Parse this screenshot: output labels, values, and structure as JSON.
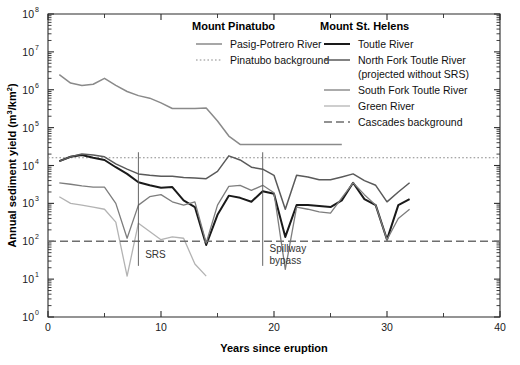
{
  "figure": {
    "background_color": "#ffffff",
    "width": 520,
    "height": 365
  },
  "axes": {
    "xlabel": "Years since eruption",
    "ylabel_main": "Annual sediment yield (m",
    "ylabel_sup1": "3",
    "ylabel_mid": "/km",
    "ylabel_sup2": "2",
    "ylabel_end": ")",
    "x_ticklabels": [
      "0",
      "10",
      "20",
      "30",
      "40"
    ],
    "x_tickvalues": [
      0,
      10,
      20,
      30,
      40
    ],
    "x_minor_step": 5,
    "y_ticklabels": [
      "10",
      "10",
      "10",
      "10",
      "10",
      "10",
      "10",
      "10",
      "10"
    ],
    "y_tick_exponents": [
      "0",
      "1",
      "2",
      "3",
      "4",
      "5",
      "6",
      "7",
      "8"
    ]
  },
  "legend": {
    "group_pinatubo": {
      "title": "Mount Pinatubo",
      "items": [
        {
          "label": "Pasig-Potrero River",
          "color": "#8a8a8a",
          "style": "solid",
          "width": 1.5
        },
        {
          "label": "Pinatubo background",
          "color": "#8a8a8a",
          "style": "dotted",
          "width": 1.2
        }
      ]
    },
    "group_sthelens": {
      "title": "Mount St. Helens",
      "items": [
        {
          "label": "Toutle River",
          "color": "#1a1a1a",
          "style": "solid",
          "width": 2.0
        },
        {
          "label": "North Fork Toutle River",
          "label2": "(projected without SRS)",
          "color": "#5a5a5a",
          "style": "solid",
          "width": 1.5
        },
        {
          "label": "South Fork Toutle River",
          "color": "#7d7d7d",
          "style": "solid",
          "width": 1.3
        },
        {
          "label": "Green River",
          "color": "#b3b3b3",
          "style": "solid",
          "width": 1.3
        },
        {
          "label": "Cascades background",
          "color": "#6e6e6e",
          "style": "dashdot",
          "width": 1.4
        }
      ]
    }
  },
  "annotations": [
    {
      "name": "srs-marker",
      "label": "SRS",
      "x": 8,
      "label_x": 8.6,
      "label_y_log": 1.55
    },
    {
      "name": "spillway-bypass-marker",
      "label": "Spillway",
      "label2": "bypass",
      "x": 19,
      "label_x": 19.6,
      "label_y_log": 1.72
    }
  ],
  "chart_data": {
    "type": "line",
    "title": "",
    "xlabel": "Years since eruption",
    "ylabel": "Annual sediment yield (m3/km2)",
    "yscale": "log",
    "xlim": [
      0,
      40
    ],
    "ylim": [
      1,
      100000000
    ],
    "grid": false,
    "legend_position": "top-center",
    "series": [
      {
        "name": "Pasig-Potrero River",
        "group": "Mount Pinatubo",
        "color": "#8a8a8a",
        "style": "solid",
        "x": [
          1,
          2,
          3,
          4,
          5,
          6,
          7,
          8,
          9,
          10,
          11,
          12,
          13,
          14,
          15,
          16,
          17,
          18,
          19,
          20,
          21,
          22,
          23,
          24,
          25,
          26
        ],
        "y": [
          2500000,
          1500000,
          1300000,
          1400000,
          2000000,
          1300000,
          900000,
          700000,
          600000,
          450000,
          320000,
          320000,
          320000,
          330000,
          150000,
          60000,
          36000,
          36000,
          36000,
          36000,
          36000,
          36000,
          36000,
          36000,
          36000,
          36000
        ]
      },
      {
        "name": "Pinatubo background",
        "group": "Mount Pinatubo",
        "color": "#8a8a8a",
        "style": "dotted",
        "constant": 16000,
        "x": [
          0,
          40
        ]
      },
      {
        "name": "Toutle River",
        "group": "Mount St. Helens",
        "color": "#1a1a1a",
        "style": "solid",
        "x": [
          1,
          2,
          3,
          4,
          5,
          6,
          7,
          8,
          9,
          10,
          11,
          12,
          13,
          14,
          15,
          16,
          17,
          18,
          19,
          20,
          21,
          22,
          23,
          24,
          25,
          26,
          27,
          28,
          29,
          30,
          31,
          32
        ],
        "y": [
          13000,
          17000,
          19000,
          16000,
          14000,
          9000,
          6000,
          3600,
          3000,
          2600,
          2700,
          1200,
          800,
          80,
          500,
          1600,
          1400,
          1100,
          2100,
          1800,
          130,
          900,
          900,
          850,
          800,
          1200,
          3500,
          1300,
          900,
          110,
          900,
          1300
        ]
      },
      {
        "name": "North Fork Toutle River (projected without SRS)",
        "group": "Mount St. Helens",
        "color": "#5a5a5a",
        "style": "solid",
        "x": [
          1,
          2,
          3,
          4,
          5,
          6,
          7,
          8,
          9,
          10,
          11,
          12,
          13,
          14,
          15,
          16,
          17,
          18,
          19,
          20,
          21,
          22,
          23,
          24,
          25,
          26,
          27,
          28,
          29,
          30,
          31,
          32
        ],
        "y": [
          13000,
          17000,
          20000,
          19000,
          17000,
          11000,
          8000,
          6000,
          5500,
          5200,
          5200,
          4800,
          4700,
          4500,
          7000,
          18000,
          14000,
          9000,
          8000,
          5500,
          700,
          5500,
          5000,
          4200,
          4200,
          5000,
          6000,
          4000,
          3000,
          1100,
          2000,
          3500
        ]
      },
      {
        "name": "South Fork Toutle River",
        "group": "Mount St. Helens",
        "color": "#7d7d7d",
        "style": "solid",
        "x": [
          1,
          2,
          3,
          4,
          5,
          6,
          7,
          8,
          9,
          10,
          11,
          12,
          13,
          14,
          15,
          16,
          17,
          18,
          19,
          20,
          21,
          22,
          23,
          24,
          25,
          26,
          27,
          28,
          29,
          30,
          31,
          32
        ],
        "y": [
          3500,
          3200,
          2900,
          2700,
          2700,
          1000,
          120,
          900,
          1500,
          1700,
          1100,
          900,
          1100,
          90,
          900,
          2800,
          3000,
          2200,
          3000,
          1900,
          18,
          800,
          700,
          600,
          550,
          1400,
          3500,
          1700,
          900,
          110,
          400,
          700
        ]
      },
      {
        "name": "Green River",
        "group": "Mount St. Helens",
        "color": "#b3b3b3",
        "style": "solid",
        "x": [
          1,
          2,
          3,
          4,
          5,
          6,
          7,
          8,
          9,
          10,
          11,
          12,
          13,
          14
        ],
        "y": [
          1500,
          1000,
          900,
          800,
          700,
          320,
          12,
          300,
          180,
          110,
          130,
          120,
          25,
          12
        ]
      },
      {
        "name": "Cascades background",
        "group": "Mount St. Helens",
        "color": "#6e6e6e",
        "style": "dashdot",
        "constant": 100,
        "x": [
          0,
          40
        ]
      }
    ]
  }
}
